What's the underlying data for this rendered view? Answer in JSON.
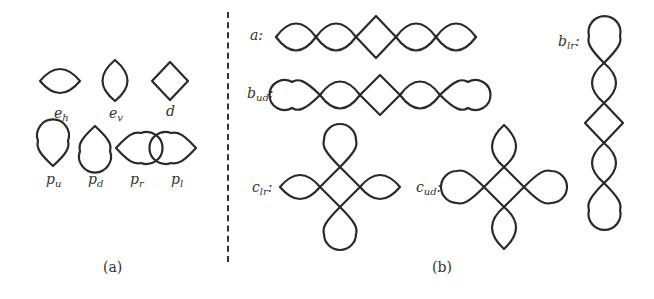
{
  "figure": {
    "panels": [
      {
        "id": "a",
        "caption": "(a)",
        "primitives": [
          {
            "name": "e",
            "sub": "h",
            "description": "horizontal lens (curved top and bottom, pointed left/right)"
          },
          {
            "name": "e",
            "sub": "v",
            "description": "vertical lens (curved left and right, pointed top/bottom)"
          },
          {
            "name": "d",
            "sub": "",
            "description": "diamond"
          },
          {
            "name": "p",
            "sub": "u",
            "description": "teardrop, round top, point down"
          },
          {
            "name": "p",
            "sub": "d",
            "description": "teardrop, point up, round bottom"
          },
          {
            "name": "p",
            "sub": "r",
            "description": "teardrop, point left, round right"
          },
          {
            "name": "p",
            "sub": "l",
            "description": "teardrop, round left, point right"
          }
        ]
      },
      {
        "id": "b",
        "caption": "(b)",
        "patterns": [
          {
            "name": "a",
            "sub": "",
            "label": "a:",
            "orientation": "horizontal"
          },
          {
            "name": "b",
            "sub": "ud",
            "label": "b_ud:",
            "orientation": "horizontal"
          },
          {
            "name": "c",
            "sub": "lr",
            "label": "c_lr:",
            "orientation": "cross"
          },
          {
            "name": "c",
            "sub": "ud",
            "label": "c_ud:",
            "orientation": "cross"
          },
          {
            "name": "b",
            "sub": "lr",
            "label": "b_lr:",
            "orientation": "vertical"
          }
        ]
      }
    ],
    "colors": {
      "stroke": "#2a2a2a",
      "background": "#ffffff",
      "divider": "#333333"
    }
  }
}
